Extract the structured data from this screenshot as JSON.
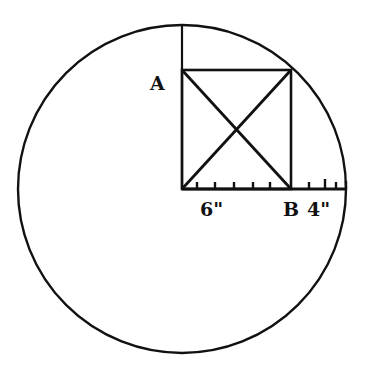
{
  "figure": {
    "type": "geometry-diagram",
    "colors": {
      "stroke": "#111111",
      "background": "#ffffff"
    },
    "circle": {
      "cx": 182,
      "cy": 189,
      "r": 164
    },
    "rectangle": {
      "x1": 182,
      "y1": 70,
      "x2": 291,
      "y2": 189
    },
    "radius_line": {
      "x1": 182,
      "y1": 189,
      "x2": 346,
      "y2": 189
    },
    "vertical_radius": {
      "x1": 182,
      "y1": 25,
      "x2": 182,
      "y2": 189
    },
    "ticks": [
      {
        "x": 197,
        "height": 7
      },
      {
        "x": 215,
        "height": 7
      },
      {
        "x": 234,
        "height": 7
      },
      {
        "x": 253,
        "height": 7
      },
      {
        "x": 270,
        "height": 7
      },
      {
        "x": 309,
        "height": 7
      },
      {
        "x": 325,
        "height": 10
      },
      {
        "x": 336,
        "height": 7
      }
    ]
  },
  "labels": {
    "point_a": "A",
    "point_b": "B",
    "segment_left": "6\"",
    "segment_right": "4\""
  }
}
